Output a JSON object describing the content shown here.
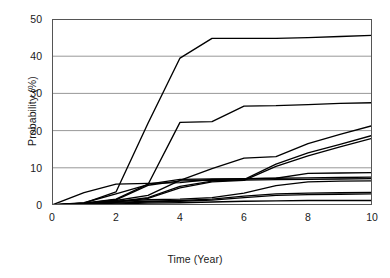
{
  "chart_data": {
    "type": "line",
    "title": "",
    "xlabel": "Time (Year)",
    "ylabel": "Probability (%)",
    "xlim": [
      0,
      10
    ],
    "ylim": [
      0,
      50
    ],
    "xticks": [
      0,
      2,
      4,
      6,
      8,
      10
    ],
    "yticks": [
      0,
      10,
      20,
      30,
      40,
      50
    ],
    "xtick_labels": [
      "0",
      "2",
      "4",
      "6",
      "8",
      "10"
    ],
    "ytick_labels": [
      "0",
      "10",
      "20",
      "30",
      "40",
      "50"
    ],
    "grid": "horizontal",
    "legend": "none",
    "line_color": "#000000",
    "grid_color": "#8c8c8c",
    "axis_color": "#555555",
    "background": "#ffffff",
    "x": [
      0,
      1,
      2,
      3,
      4,
      5,
      6,
      7,
      8,
      9,
      10
    ],
    "series": [
      {
        "name": "curve-1",
        "values": [
          0,
          0.5,
          3.5,
          22.0,
          39.5,
          44.8,
          44.8,
          44.8,
          45.0,
          45.3,
          45.6
        ]
      },
      {
        "name": "curve-2",
        "values": [
          0,
          0.6,
          3.0,
          5.5,
          22.2,
          22.4,
          26.6,
          26.7,
          27.0,
          27.3,
          27.5
        ]
      },
      {
        "name": "curve-3",
        "values": [
          0,
          0.4,
          1.2,
          2.6,
          6.6,
          9.8,
          12.6,
          13.0,
          16.5,
          19.0,
          21.3
        ]
      },
      {
        "name": "curve-4",
        "values": [
          0,
          0.3,
          0.9,
          2.0,
          5.0,
          6.4,
          6.8,
          11.0,
          14.0,
          16.3,
          18.7
        ]
      },
      {
        "name": "curve-5",
        "values": [
          0,
          0.2,
          0.8,
          1.8,
          4.6,
          6.2,
          6.6,
          10.4,
          13.2,
          15.6,
          17.9
        ]
      },
      {
        "name": "curve-6",
        "values": [
          0,
          3.3,
          5.6,
          5.8,
          6.0,
          6.9,
          7.0,
          7.2,
          8.5,
          8.6,
          8.7
        ]
      },
      {
        "name": "curve-7",
        "values": [
          0,
          0.5,
          1.6,
          5.6,
          6.9,
          7.0,
          7.1,
          7.2,
          7.3,
          7.4,
          7.5
        ]
      },
      {
        "name": "curve-8",
        "values": [
          0,
          0.4,
          1.4,
          5.3,
          6.5,
          6.6,
          6.7,
          6.8,
          6.9,
          7.0,
          7.1
        ]
      },
      {
        "name": "curve-9",
        "values": [
          0,
          0.3,
          1.0,
          1.4,
          1.6,
          2.0,
          3.2,
          5.2,
          6.2,
          6.4,
          6.5
        ]
      },
      {
        "name": "curve-10",
        "values": [
          0,
          0.2,
          0.7,
          1.0,
          1.2,
          1.6,
          2.4,
          3.0,
          3.2,
          3.3,
          3.4
        ]
      },
      {
        "name": "curve-11",
        "values": [
          0,
          0.1,
          0.5,
          0.8,
          1.0,
          1.3,
          2.0,
          2.6,
          2.8,
          2.9,
          3.0
        ]
      },
      {
        "name": "curve-12",
        "values": [
          0,
          0.1,
          0.3,
          0.5,
          0.6,
          0.8,
          1.0,
          1.1,
          1.2,
          1.2,
          1.2
        ]
      }
    ]
  }
}
